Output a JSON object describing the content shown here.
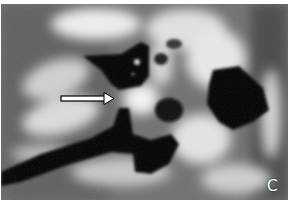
{
  "figure": {
    "type": "grayscale CT scan (temporal bone)",
    "panel_label": "C",
    "annotations": [
      {
        "type": "arrow",
        "direction": "right",
        "color": "#ffffff",
        "outline": "#000000"
      }
    ],
    "colors": {
      "background": "#6e6e6e",
      "bone": "#e8e8e8",
      "air": "#050505",
      "border": "#ffffff"
    }
  }
}
